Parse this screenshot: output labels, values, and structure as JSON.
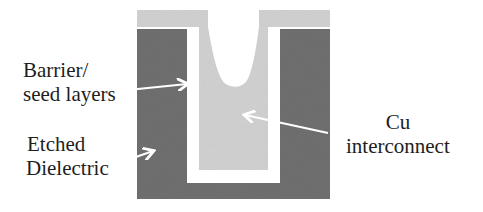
{
  "diagram": {
    "colors": {
      "background": "#ffffff",
      "dielectric": "#707070",
      "barrier_seed": "#ffffff",
      "copper": "#d2d2d2",
      "arrow": "#ffffff"
    },
    "labels": {
      "barrier": {
        "line1": "Barrier/",
        "line2": "seed layers"
      },
      "etched": {
        "line1": "Etched",
        "line2": "Dielectric"
      },
      "cu": {
        "line1": "Cu",
        "line2": "interconnect"
      }
    },
    "geometry": {
      "dielectric": {
        "x": 137,
        "y": 29,
        "w": 193,
        "h": 170
      },
      "trench_barrier": {
        "x": 187,
        "y": 29,
        "w": 93,
        "h": 154
      },
      "copper_fill": {
        "x": 199,
        "y": 29,
        "w": 69,
        "h": 141
      },
      "overburden_top": {
        "y": 10,
        "h": 17
      },
      "overburden_opening": {
        "x1": 208,
        "x2": 259
      },
      "dip_bottom_y": 87
    },
    "arrows": [
      {
        "target": "barrier",
        "x1": 128,
        "y1": 90,
        "x2": 188,
        "y2": 84
      },
      {
        "target": "etched",
        "x1": 133,
        "y1": 158,
        "x2": 153,
        "y2": 151
      },
      {
        "target": "cu",
        "x1": 328,
        "y1": 133,
        "x2": 244,
        "y2": 115
      }
    ]
  }
}
